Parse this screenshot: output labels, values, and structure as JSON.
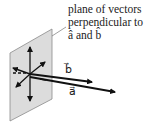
{
  "caption": {
    "line1": "plane of vectors",
    "line2": "perpendicular to",
    "line3": "â and b̂"
  },
  "vectors": {
    "b_label": "b⃗",
    "a_label": "a⃗"
  },
  "colors": {
    "plane_fill": "#dcdcdc",
    "plane_edge": "#8a8a8a",
    "ink": "#111111"
  }
}
